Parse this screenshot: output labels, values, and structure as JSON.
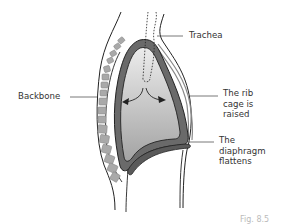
{
  "diagram": {
    "colors": {
      "outline": "#222222",
      "lung_wall": "#6a6a6a",
      "lung_fill_top": "#e6e6e6",
      "lung_fill_bottom": "#a6a6a6",
      "vertebra": "#a9a9a9",
      "leader": "#555555"
    },
    "labels": {
      "trachea": "Trachea",
      "backbone": "Backbone",
      "rib_cage": "The rib\ncage is\nraised",
      "diaphragm": "The\ndiaphragm\nflattens"
    },
    "caption_fragment": "Fig. 8.5"
  }
}
